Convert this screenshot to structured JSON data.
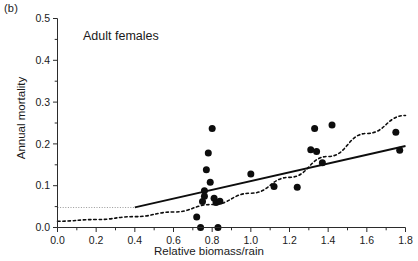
{
  "figure": {
    "panel_label": "(b)",
    "annotation": "Adult females"
  },
  "chart_data": {
    "type": "scatter",
    "title": "Adult females",
    "xlabel": "Relative biomass/rain",
    "ylabel": "Annual mortality",
    "xlim": [
      0.0,
      1.8
    ],
    "ylim": [
      0.0,
      0.5
    ],
    "xticks": [
      0.0,
      0.2,
      0.4,
      0.6,
      0.8,
      1.0,
      1.2,
      1.4,
      1.6,
      1.8
    ],
    "xtick_labels": [
      "0.0",
      "0.2",
      "0.4",
      "0.6",
      "0.8",
      "1.0",
      "1.2",
      "1.4",
      "1.6",
      "1.8"
    ],
    "yticks": [
      0.0,
      0.1,
      0.2,
      0.3,
      0.4,
      0.5
    ],
    "ytick_labels": [
      "0.0",
      "0.1",
      "0.2",
      "0.3",
      "0.4",
      "0.5"
    ],
    "minor_tick_step_x": 0.1,
    "minor_tick_step_y": 0.05,
    "grid": false,
    "legend": null,
    "points": [
      {
        "x": 0.72,
        "y": 0.025
      },
      {
        "x": 0.74,
        "y": 0.0
      },
      {
        "x": 0.75,
        "y": 0.062
      },
      {
        "x": 0.76,
        "y": 0.088
      },
      {
        "x": 0.76,
        "y": 0.075
      },
      {
        "x": 0.77,
        "y": 0.138
      },
      {
        "x": 0.78,
        "y": 0.178
      },
      {
        "x": 0.79,
        "y": 0.108
      },
      {
        "x": 0.8,
        "y": 0.237
      },
      {
        "x": 0.81,
        "y": 0.07
      },
      {
        "x": 0.82,
        "y": 0.06
      },
      {
        "x": 0.83,
        "y": 0.0
      },
      {
        "x": 0.84,
        "y": 0.063
      },
      {
        "x": 1.0,
        "y": 0.128
      },
      {
        "x": 1.12,
        "y": 0.098
      },
      {
        "x": 1.24,
        "y": 0.096
      },
      {
        "x": 1.31,
        "y": 0.186
      },
      {
        "x": 1.33,
        "y": 0.237
      },
      {
        "x": 1.34,
        "y": 0.182
      },
      {
        "x": 1.37,
        "y": 0.155
      },
      {
        "x": 1.42,
        "y": 0.245
      },
      {
        "x": 1.75,
        "y": 0.228
      },
      {
        "x": 1.77,
        "y": 0.185
      }
    ],
    "series": [
      {
        "name": "fitted-linear",
        "style": "solid",
        "x": [
          0.4,
          1.8
        ],
        "y": [
          0.048,
          0.195
        ]
      },
      {
        "name": "fitted-curve",
        "style": "dashed",
        "x": [
          0.0,
          0.2,
          0.4,
          0.6,
          0.8,
          1.0,
          1.2,
          1.4,
          1.6,
          1.8
        ],
        "y": [
          0.015,
          0.019,
          0.026,
          0.037,
          0.055,
          0.082,
          0.12,
          0.17,
          0.225,
          0.268
        ]
      },
      {
        "name": "reference-level",
        "style": "dotted-gray",
        "x": [
          0.0,
          0.4
        ],
        "y": [
          0.048,
          0.048
        ]
      }
    ]
  },
  "colors": {
    "axis": "#2b2b2b",
    "point": "#0d0d0d",
    "line": "#0d0d0d",
    "reference": "#9a9a9a",
    "background": "#ffffff"
  }
}
